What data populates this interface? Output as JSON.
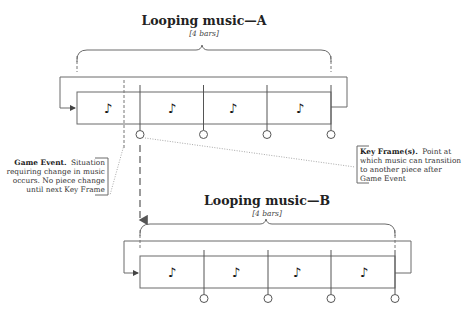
{
  "loop_a": {
    "title": "Looping music—A",
    "bars_label": "[4 bars]",
    "bar_count": 4,
    "note_symbol": "♪"
  },
  "loop_b": {
    "title": "Looping music—B",
    "bars_label": "[4 bars]",
    "bar_count": 4,
    "note_symbol": "♪"
  },
  "annotations": {
    "game_event": {
      "heading": "Game Event.",
      "lines": [
        "Situation",
        "requiring change in music",
        "occurs. No piece change",
        "until next Key Frame"
      ]
    },
    "key_frame": {
      "heading": "Key Frame(s).",
      "lines": [
        "Point at",
        "which music can transition",
        "to another piece after",
        "Game Event"
      ]
    }
  }
}
